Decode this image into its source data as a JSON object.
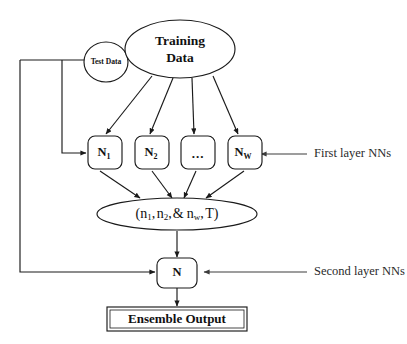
{
  "diagram": {
    "colors": {
      "stroke": "#1a1a1a",
      "annotation_stroke": "#3c3c3c",
      "background": "#ffffff",
      "text": "#111111"
    },
    "sources": {
      "test_data": {
        "label": "Test Data"
      },
      "training_data": {
        "line1": "Training",
        "line2": "Data"
      }
    },
    "first_layer": {
      "annotation": "First layer NNs",
      "nodes": [
        {
          "base": "N",
          "sub": "1",
          "is_ellipsis": false
        },
        {
          "base": "N",
          "sub": "2",
          "is_ellipsis": false
        },
        {
          "base": "...",
          "sub": "",
          "is_ellipsis": true
        },
        {
          "base": "N",
          "sub": "W",
          "is_ellipsis": false
        }
      ]
    },
    "aggregate": {
      "open_paren": "(",
      "terms": [
        {
          "base": "n",
          "sub": "1",
          "after": ","
        },
        {
          "base": "n",
          "sub": "2",
          "after": ","
        },
        {
          "base": "&",
          "sub": "",
          "after": ""
        },
        {
          "base": "n",
          "sub": "w",
          "after": ","
        },
        {
          "base": "T",
          "sub": "",
          "after": ""
        }
      ],
      "close_paren": ")",
      "plain_text": "(n1, n2, & nw, T)"
    },
    "second_layer": {
      "annotation": "Second layer NNs",
      "node": {
        "base": "N",
        "sub": ""
      }
    },
    "output": {
      "label": "Ensemble Output"
    }
  }
}
